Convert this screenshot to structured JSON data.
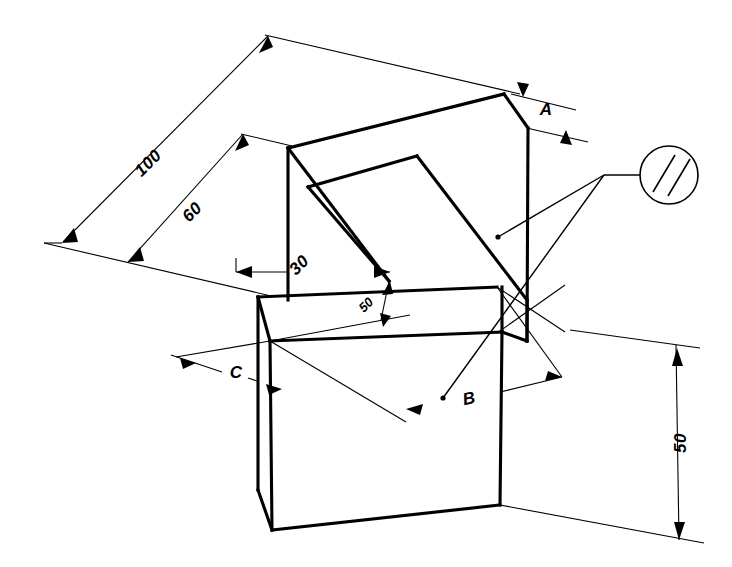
{
  "drawing": {
    "title": "Isometric mechanical part drawing",
    "background_color": "#ffffff",
    "line_color": "#000000",
    "dimensions": [
      {
        "id": "dim-100",
        "label": "100",
        "rotation": -32,
        "x": 152,
        "y": 167,
        "description": "overall length along top-left isometric axis"
      },
      {
        "id": "dim-60",
        "label": "60",
        "rotation": -32,
        "x": 196,
        "y": 216,
        "description": "inner length along top-left isometric axis"
      },
      {
        "id": "dim-30",
        "label": "30",
        "rotation": -32,
        "x": 303,
        "y": 269,
        "description": "notch depth dimension"
      },
      {
        "id": "dim-50-small",
        "label": "50",
        "rotation": -30,
        "x": 369,
        "y": 308,
        "description": "small stepped dimension near top face of base"
      },
      {
        "id": "dim-A",
        "label": "A",
        "rotation": 0,
        "x": 544,
        "y": 113,
        "description": "unknown thickness dimension at top right"
      },
      {
        "id": "dim-B",
        "label": "B",
        "rotation": -12,
        "x": 468,
        "y": 404,
        "description": "unknown width dimension across base front face"
      },
      {
        "id": "dim-C",
        "label": "C",
        "rotation": 0,
        "x": 234,
        "y": 375,
        "description": "unknown width dimension at base left"
      },
      {
        "id": "dim-50-right",
        "label": "50",
        "rotation": 0,
        "x": 684,
        "y": 437,
        "description": "base height dimension at far right"
      }
    ],
    "symbols": [
      {
        "id": "surface-finish-symbol",
        "name": "hatched-circle-symbol",
        "cx": 669,
        "cy": 175,
        "r": 29,
        "hatch_count": 2,
        "description": "circle containing two parallel diagonal hatch lines, with leader lines to two surfaces"
      }
    ],
    "geometry_notes": {
      "object": "V-notched isometric block on rectangular base",
      "projection": "isometric",
      "visible_faces": [
        "top",
        "front-left",
        "front-right",
        "notch-interior"
      ]
    }
  }
}
